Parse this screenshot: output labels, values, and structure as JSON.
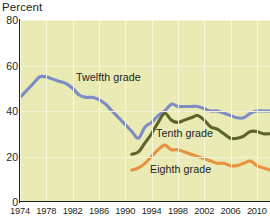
{
  "axis_title": "Percent",
  "y_ticks": [
    {
      "value": 0,
      "label": "0"
    },
    {
      "value": 20,
      "label": "20"
    },
    {
      "value": 40,
      "label": "40"
    },
    {
      "value": 60,
      "label": "60"
    },
    {
      "value": 80,
      "label": "80"
    }
  ],
  "x_ticks": [
    {
      "value": 1974,
      "label": "1974"
    },
    {
      "value": 1978,
      "label": "1978"
    },
    {
      "value": 1982,
      "label": "1982"
    },
    {
      "value": 1986,
      "label": "1986"
    },
    {
      "value": 1990,
      "label": "1990"
    },
    {
      "value": 1994,
      "label": "1994"
    },
    {
      "value": 1998,
      "label": "1998"
    },
    {
      "value": 2002,
      "label": "2002"
    },
    {
      "value": 2006,
      "label": "2006"
    },
    {
      "value": 2010,
      "label": "2010"
    }
  ],
  "series_labels": {
    "twelfth": "Twelfth grade",
    "tenth": "Tenth grade",
    "eighth": "Eighth grade"
  },
  "colors": {
    "panel_background": "#e9eab4",
    "gridline": "#f7f8e2",
    "axis": "#231f20",
    "twelfth": "#7d8cc4",
    "tenth": "#5c6429",
    "eighth": "#e89240",
    "text": "#231f20"
  },
  "chart_data": {
    "type": "line",
    "title": "",
    "xlabel": "",
    "ylabel": "Percent",
    "xlim": [
      1974,
      2012
    ],
    "ylim": [
      0,
      80
    ],
    "grid": true,
    "legend_position": "inline-annotations",
    "x_tick_interval": 4,
    "y_tick_interval": 20,
    "series": [
      {
        "name": "Twelfth grade",
        "color": "#7d8cc4",
        "x": [
          1974,
          1975,
          1976,
          1977,
          1978,
          1979,
          1980,
          1981,
          1982,
          1983,
          1984,
          1985,
          1986,
          1987,
          1988,
          1989,
          1990,
          1991,
          1992,
          1993,
          1994,
          1995,
          1996,
          1997,
          1998,
          1999,
          2000,
          2001,
          2002,
          2003,
          2004,
          2005,
          2006,
          2007,
          2008,
          2009,
          2010,
          2011,
          2012
        ],
        "values": [
          46,
          49,
          52,
          55,
          55,
          54,
          53,
          52,
          50,
          47,
          46,
          46,
          45,
          43,
          40,
          37,
          34,
          31,
          28,
          33,
          35,
          38,
          40,
          43,
          42,
          42,
          42,
          42,
          41,
          40,
          40,
          39,
          38,
          37,
          37,
          39,
          40,
          40,
          40
        ]
      },
      {
        "name": "Tenth grade",
        "color": "#5c6429",
        "x": [
          1991,
          1992,
          1993,
          1994,
          1995,
          1996,
          1997,
          1998,
          1999,
          2000,
          2001,
          2002,
          2003,
          2004,
          2005,
          2006,
          2007,
          2008,
          2009,
          2010,
          2011,
          2012
        ],
        "values": [
          21,
          22,
          26,
          30,
          35,
          39,
          36,
          35,
          36,
          37,
          38,
          36,
          33,
          32,
          30,
          28,
          28,
          29,
          31,
          31,
          30,
          30
        ]
      },
      {
        "name": "Eighth grade",
        "color": "#e89240",
        "x": [
          1991,
          1992,
          1993,
          1994,
          1995,
          1996,
          1997,
          1998,
          1999,
          2000,
          2001,
          2002,
          2003,
          2004,
          2005,
          2006,
          2007,
          2008,
          2009,
          2010,
          2011,
          2012
        ],
        "values": [
          14,
          15,
          17,
          20,
          23,
          25,
          23,
          23,
          22,
          21,
          20,
          19,
          18,
          17,
          17,
          16,
          16,
          17,
          18,
          16,
          15,
          14
        ]
      }
    ]
  }
}
